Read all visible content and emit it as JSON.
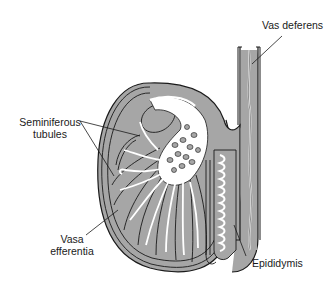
{
  "diagram": {
    "colors": {
      "tissue_fill": "#a6a6a6",
      "outline": "#1a1a1a",
      "lumen": "#ffffff",
      "background": "#ffffff"
    },
    "labels": [
      {
        "id": "vas-deferens",
        "text": "Vas deferens"
      },
      {
        "id": "seminiferous-tubules",
        "line1": "Seminiferous",
        "line2": "tubules"
      },
      {
        "id": "vasa-efferentia",
        "line1": "Vasa",
        "line2": "efferentia"
      },
      {
        "id": "epididymis",
        "text": "Epididymis"
      }
    ]
  }
}
